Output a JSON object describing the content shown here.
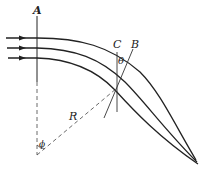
{
  "diagram": {
    "labels": {
      "A": "A",
      "B": "B",
      "C": "C",
      "theta": "θ",
      "R": "R",
      "phi": "ϕ"
    },
    "rays": {
      "count": 3,
      "direction": "left-to-right, curving downward and converging"
    },
    "colors": {
      "stroke": "#222222",
      "background": "#ffffff"
    }
  }
}
